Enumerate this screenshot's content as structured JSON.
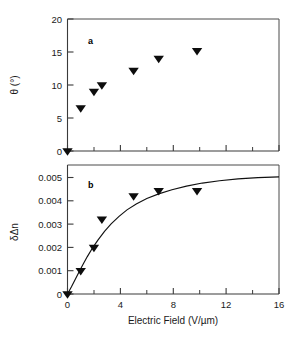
{
  "chart_data": [
    {
      "type": "scatter",
      "panel_label": "a",
      "title": "",
      "xlabel": "",
      "ylabel": "θ (°)",
      "xlim": [
        0,
        16
      ],
      "ylim": [
        0,
        20
      ],
      "xticks": [
        0,
        4,
        8,
        12,
        16
      ],
      "xtick_labels": [
        "0",
        "4",
        "8",
        "12",
        "16"
      ],
      "xminor_ticks": [
        2,
        6,
        10,
        14
      ],
      "yticks": [
        0,
        5,
        10,
        15,
        20
      ],
      "ytick_labels": [
        "0",
        "5",
        "10",
        "15",
        "20"
      ],
      "grid": false,
      "legend": "none",
      "marker": "filled-down-triangle",
      "series": [
        {
          "name": "tilt angle",
          "x": [
            0,
            1.0,
            2.0,
            2.6,
            5.0,
            6.9,
            9.8
          ],
          "y": [
            0,
            6.5,
            9.0,
            10.0,
            12.2,
            14.0,
            15.2
          ]
        }
      ]
    },
    {
      "type": "scatter",
      "panel_label": "b",
      "title": "",
      "xlabel": "Electric Field (V/µm)",
      "ylabel": "δΔn",
      "xlim": [
        0,
        16
      ],
      "ylim": [
        0,
        0.005
      ],
      "xticks": [
        0,
        4,
        8,
        12,
        16
      ],
      "xtick_labels": [
        "0",
        "4",
        "8",
        "12",
        "16"
      ],
      "xminor_ticks": [
        2,
        6,
        10,
        14
      ],
      "yticks": [
        0,
        0.001,
        0.002,
        0.003,
        0.004,
        0.005
      ],
      "ytick_labels": [
        "0",
        "0.001",
        "0.002",
        "0.003",
        "0.004",
        "0.005"
      ],
      "grid": false,
      "legend": "none",
      "marker": "filled-down-triangle",
      "series": [
        {
          "name": "birefringence change",
          "x": [
            0,
            1.0,
            2.0,
            2.6,
            5.0,
            6.9,
            9.8
          ],
          "y": [
            0,
            0.0009,
            0.0018,
            0.0029,
            0.0038,
            0.004,
            0.004
          ]
        }
      ],
      "fit_curve": {
        "name": "saturation fit",
        "x": [
          0,
          0.3,
          0.6,
          0.9,
          1.2,
          1.5,
          1.9,
          2.3,
          2.8,
          3.3,
          3.9,
          4.5,
          5.2,
          6.0,
          6.9,
          7.9,
          9.0,
          10.2,
          11.5,
          12.9,
          14.4,
          16.0
        ],
        "y": [
          0.0,
          0.00028,
          0.00058,
          0.00088,
          0.00117,
          0.00145,
          0.00179,
          0.00209,
          0.00243,
          0.00272,
          0.00301,
          0.00326,
          0.00349,
          0.0037,
          0.00388,
          0.00404,
          0.00418,
          0.0043,
          0.00439,
          0.00446,
          0.00451,
          0.00454
        ]
      }
    }
  ],
  "colors": {
    "marker": "#0d0d0d",
    "axis": "#3a3a3a",
    "curve": "#111111",
    "text": "#1a1a1a",
    "background": "#ffffff"
  },
  "axis_titles": {
    "top_y": "θ (°)",
    "bottom_y": "δΔn",
    "x": "Electric Field (V/µm)"
  },
  "panel_labels": {
    "top": "a",
    "bottom": "b"
  },
  "tick_labels": {
    "top_y": [
      "20",
      "15",
      "10",
      "5",
      "0"
    ],
    "bottom_y": [
      "0.005",
      "0.004",
      "0.003",
      "0.002",
      "0.001",
      "0"
    ],
    "x": [
      "0",
      "4",
      "8",
      "12",
      "16"
    ]
  }
}
